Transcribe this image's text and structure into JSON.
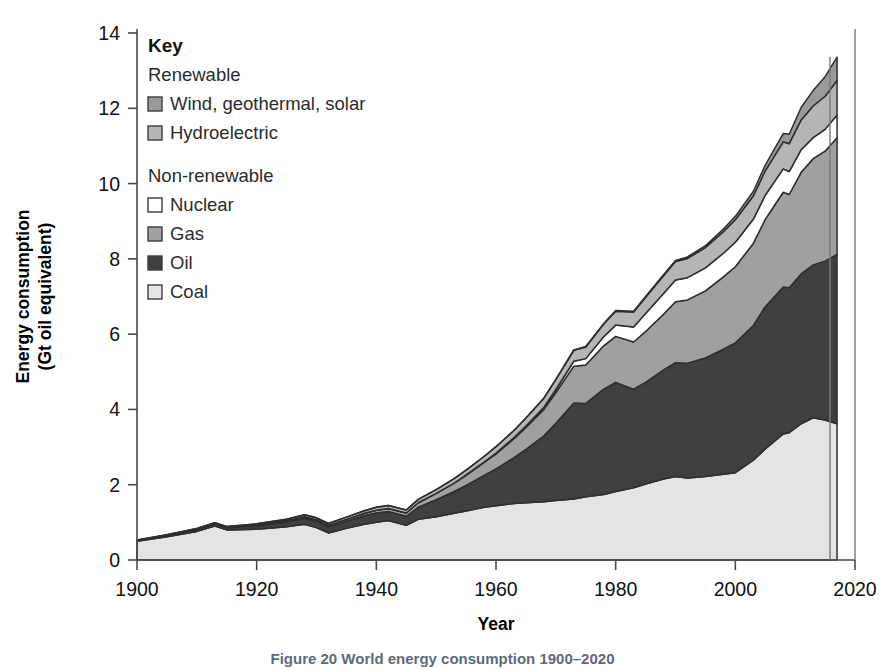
{
  "figure": {
    "caption": "Figure 20 World energy consumption 1900–2020"
  },
  "axes": {
    "ylabel_line1": "Energy consumption",
    "ylabel_line2": "(Gt oil equivalent)",
    "xlabel": "Year",
    "yticks": [
      "0",
      "2",
      "4",
      "6",
      "8",
      "10",
      "12",
      "14"
    ],
    "xticks": [
      "1900",
      "1920",
      "1940",
      "1960",
      "1980",
      "2000",
      "2020"
    ]
  },
  "legend": {
    "title": "Key",
    "groups": [
      {
        "name": "Renewable",
        "items": [
          {
            "label": "Wind, geothermal, solar",
            "color": "#9a9a9a"
          },
          {
            "label": "Hydroelectric",
            "color": "#b5b5b5"
          }
        ]
      },
      {
        "name": "Non-renewable",
        "items": [
          {
            "label": "Nuclear",
            "color": "#ffffff"
          },
          {
            "label": "Gas",
            "color": "#a0a0a0"
          },
          {
            "label": "Oil",
            "color": "#3f3f3f"
          },
          {
            "label": "Coal",
            "color": "#e4e4e4"
          }
        ]
      }
    ]
  },
  "chart_data": {
    "type": "area",
    "stacked": true,
    "title": "World energy consumption 1900–2020",
    "xlabel": "Year",
    "ylabel": "Energy consumption (Gt oil equivalent)",
    "xlim": [
      1900,
      2020
    ],
    "ylim": [
      0,
      14
    ],
    "grid": false,
    "legend_position": "inside-top-left",
    "units": "Gt oil equivalent",
    "stack_order_bottom_to_top": [
      "Coal",
      "Oil",
      "Gas",
      "Nuclear",
      "Hydroelectric",
      "Wind, geothermal, solar"
    ],
    "x": [
      1900,
      1905,
      1910,
      1913,
      1915,
      1920,
      1925,
      1928,
      1930,
      1932,
      1935,
      1938,
      1940,
      1942,
      1945,
      1947,
      1950,
      1953,
      1955,
      1958,
      1960,
      1963,
      1965,
      1968,
      1970,
      1973,
      1975,
      1978,
      1980,
      1983,
      1985,
      1988,
      1990,
      1992,
      1995,
      1998,
      2000,
      2003,
      2005,
      2008,
      2009,
      2011,
      2013,
      2015,
      2017
    ],
    "series": [
      {
        "name": "Coal",
        "color": "#e4e4e4",
        "values": [
          0.5,
          0.62,
          0.76,
          0.9,
          0.8,
          0.82,
          0.88,
          0.95,
          0.86,
          0.72,
          0.84,
          0.95,
          1.0,
          1.05,
          0.92,
          1.08,
          1.15,
          1.24,
          1.3,
          1.4,
          1.44,
          1.5,
          1.52,
          1.55,
          1.58,
          1.62,
          1.68,
          1.74,
          1.82,
          1.92,
          2.02,
          2.15,
          2.22,
          2.18,
          2.22,
          2.28,
          2.32,
          2.65,
          2.95,
          3.35,
          3.38,
          3.62,
          3.78,
          3.72,
          3.62
        ]
      },
      {
        "name": "Oil",
        "color": "#3f3f3f",
        "values": [
          0.02,
          0.03,
          0.05,
          0.06,
          0.06,
          0.09,
          0.13,
          0.16,
          0.17,
          0.16,
          0.19,
          0.23,
          0.25,
          0.24,
          0.24,
          0.32,
          0.45,
          0.58,
          0.68,
          0.85,
          0.98,
          1.22,
          1.42,
          1.75,
          2.05,
          2.55,
          2.48,
          2.8,
          2.9,
          2.62,
          2.7,
          2.9,
          3.02,
          3.05,
          3.15,
          3.32,
          3.45,
          3.58,
          3.78,
          3.9,
          3.85,
          3.98,
          4.06,
          4.22,
          4.5
        ]
      },
      {
        "name": "Gas",
        "color": "#a0a0a0",
        "values": [
          0.0,
          0.01,
          0.01,
          0.01,
          0.01,
          0.02,
          0.03,
          0.04,
          0.04,
          0.04,
          0.05,
          0.06,
          0.07,
          0.08,
          0.09,
          0.12,
          0.17,
          0.22,
          0.27,
          0.34,
          0.4,
          0.5,
          0.58,
          0.7,
          0.82,
          0.98,
          1.02,
          1.15,
          1.22,
          1.25,
          1.35,
          1.48,
          1.62,
          1.68,
          1.78,
          1.92,
          2.02,
          2.18,
          2.32,
          2.52,
          2.48,
          2.7,
          2.82,
          2.92,
          3.1
        ]
      },
      {
        "name": "Nuclear",
        "color": "#ffffff",
        "values": [
          0.0,
          0.0,
          0.0,
          0.0,
          0.0,
          0.0,
          0.0,
          0.0,
          0.0,
          0.0,
          0.0,
          0.0,
          0.0,
          0.0,
          0.0,
          0.0,
          0.0,
          0.0,
          0.01,
          0.01,
          0.02,
          0.03,
          0.04,
          0.06,
          0.08,
          0.13,
          0.17,
          0.24,
          0.3,
          0.4,
          0.48,
          0.55,
          0.58,
          0.59,
          0.61,
          0.63,
          0.65,
          0.64,
          0.64,
          0.62,
          0.61,
          0.6,
          0.56,
          0.58,
          0.6
        ]
      },
      {
        "name": "Hydroelectric",
        "color": "#b5b5b5",
        "values": [
          0.01,
          0.01,
          0.02,
          0.02,
          0.02,
          0.03,
          0.04,
          0.05,
          0.05,
          0.05,
          0.06,
          0.07,
          0.08,
          0.08,
          0.08,
          0.09,
          0.1,
          0.12,
          0.13,
          0.15,
          0.17,
          0.19,
          0.21,
          0.24,
          0.26,
          0.29,
          0.31,
          0.34,
          0.37,
          0.4,
          0.43,
          0.47,
          0.49,
          0.51,
          0.54,
          0.57,
          0.6,
          0.62,
          0.65,
          0.72,
          0.74,
          0.79,
          0.84,
          0.88,
          0.92
        ]
      },
      {
        "name": "Wind, geothermal, solar",
        "color": "#9a9a9a",
        "values": [
          0.0,
          0.0,
          0.0,
          0.0,
          0.0,
          0.0,
          0.0,
          0.0,
          0.0,
          0.0,
          0.0,
          0.0,
          0.0,
          0.0,
          0.0,
          0.0,
          0.0,
          0.0,
          0.0,
          0.0,
          0.0,
          0.0,
          0.0,
          0.0,
          0.01,
          0.01,
          0.01,
          0.01,
          0.02,
          0.02,
          0.02,
          0.03,
          0.03,
          0.04,
          0.05,
          0.07,
          0.09,
          0.12,
          0.15,
          0.22,
          0.25,
          0.33,
          0.41,
          0.52,
          0.62
        ]
      }
    ],
    "annotations": [
      "Total 2017 ≈ 13.4 Gt oil equivalent",
      "Dip around 1945 (Second World War)",
      "Dip around 2009 (financial crisis)"
    ]
  }
}
